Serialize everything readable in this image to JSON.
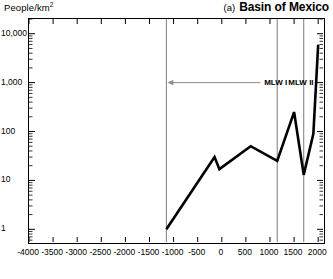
{
  "axis_label": {
    "text": "People/km",
    "sup": "2"
  },
  "title": {
    "tag": "(a)",
    "main": "Basin of Mexico"
  },
  "annotations": {
    "mlw1": "MLW I",
    "mlw2": "MLW II"
  },
  "chart_data": {
    "type": "line",
    "title": "(a) Basin of Mexico",
    "xlabel": "",
    "ylabel": "People/km2",
    "yscale": "log",
    "ylim": [
      0.55,
      20000
    ],
    "xlim": [
      -4000,
      2100
    ],
    "grid": false,
    "legend": null,
    "y_ticks": [
      {
        "value": 1,
        "label": "1"
      },
      {
        "value": 10,
        "label": "10"
      },
      {
        "value": 100,
        "label": "100"
      },
      {
        "value": 1000,
        "label": "1,000"
      },
      {
        "value": 10000,
        "label": "10,000"
      }
    ],
    "x_ticks": [
      {
        "value": -4000,
        "label": "-4000"
      },
      {
        "value": -3500,
        "label": "-3500"
      },
      {
        "value": -3000,
        "label": "-3000"
      },
      {
        "value": -2500,
        "label": "-2500"
      },
      {
        "value": -2000,
        "label": "-2000"
      },
      {
        "value": -1500,
        "label": "-1500"
      },
      {
        "value": -1000,
        "label": "-1000"
      },
      {
        "value": -500,
        "label": "-500"
      },
      {
        "value": 0,
        "label": "0"
      },
      {
        "value": 500,
        "label": "500"
      },
      {
        "value": 1000,
        "label": "1000"
      },
      {
        "value": 1500,
        "label": "1500"
      },
      {
        "value": 2000,
        "label": "2000"
      }
    ],
    "vertical_rules": [
      -1150,
      1150,
      1700
    ],
    "series": [
      {
        "name": "Population density",
        "x": [
          -1150,
          -150,
          -50,
          600,
          1150,
          1500,
          1700,
          1900,
          2000
        ],
        "y": [
          1.0,
          30,
          17,
          50,
          25,
          250,
          13,
          90,
          6000
        ]
      }
    ],
    "annotations": [
      {
        "text": "MLW I",
        "x": 900,
        "y": 1000,
        "type": "label"
      },
      {
        "text": "MLW II",
        "x": 1400,
        "y": 1000,
        "type": "label"
      },
      {
        "text": "",
        "x0": 800,
        "x1": -1130,
        "y": 1000,
        "type": "arrow-left"
      }
    ]
  }
}
